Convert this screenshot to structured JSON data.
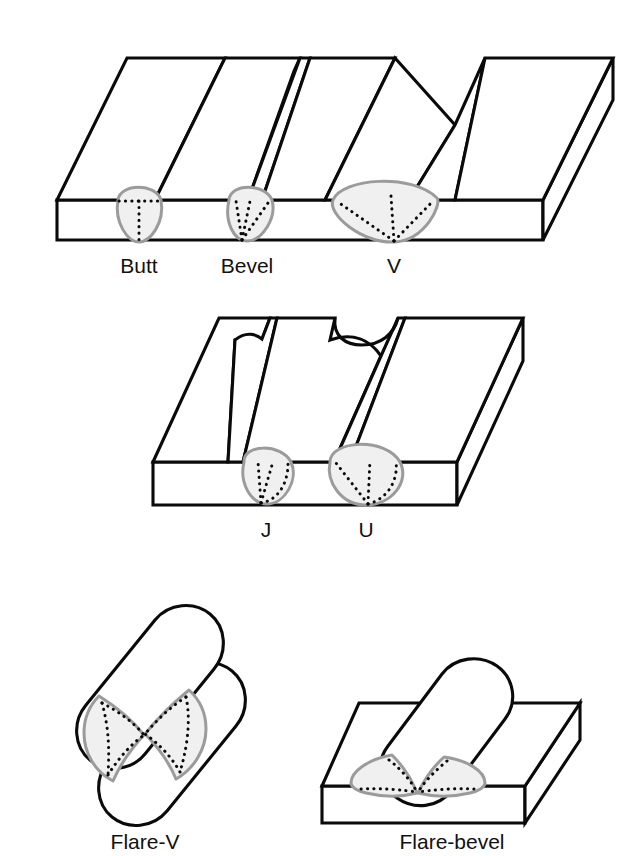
{
  "figure": {
    "background_color": "#ffffff",
    "line_color": "#0a0a0a",
    "bead_fill_color": "#f0f0f0",
    "bead_outline_color": "#9b9b9b",
    "bead_dotted_color": "#0a0a0a"
  },
  "rows": [
    {
      "name": "plate-groove-row-1",
      "joints": [
        {
          "label": "Butt",
          "groove": "square-butt"
        },
        {
          "label": "Bevel",
          "groove": "single-bevel"
        },
        {
          "label": "V",
          "groove": "single-v"
        }
      ]
    },
    {
      "name": "plate-groove-row-2",
      "joints": [
        {
          "label": "J",
          "groove": "single-j"
        },
        {
          "label": "U",
          "groove": "single-u"
        }
      ]
    },
    {
      "name": "flare-groove-row-3",
      "joints": [
        {
          "label": "Flare-V",
          "groove": "flare-v-two-rods"
        },
        {
          "label": "Flare-bevel",
          "groove": "flare-bevel-rod-on-plate"
        }
      ]
    }
  ],
  "labels": {
    "butt": "Butt",
    "bevel": "Bevel",
    "v": "V",
    "j": "J",
    "u": "U",
    "flare_v": "Flare-V",
    "flare_bevel": "Flare-bevel"
  }
}
